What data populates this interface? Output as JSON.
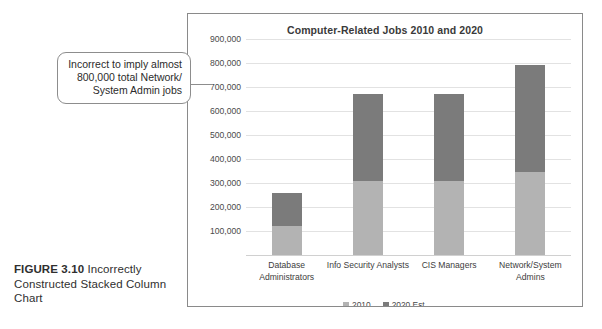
{
  "figure": {
    "label": "FIGURE 3.10",
    "caption": "Incorrectly Constructed Stacked Column Chart"
  },
  "callout": {
    "line1": "Incorrect to imply almost",
    "line2": "800,000 total Network/",
    "line3": "System Admin jobs"
  },
  "legend": {
    "items": [
      {
        "label": "2010",
        "color": "#b3b3b3"
      },
      {
        "label": "2020 Est.",
        "color": "#7b7b7b"
      }
    ]
  },
  "colors": {
    "series_2010": "#b3b3b3",
    "series_2020": "#7b7b7b",
    "gridline": "#e2e2e2",
    "frame_border": "#8a8a8a",
    "callout_border": "#8d8d8d"
  },
  "chart_data": {
    "type": "bar",
    "stacked": true,
    "title": "Computer-Related Jobs 2010 and 2020",
    "xlabel": "",
    "ylabel": "",
    "ylim": [
      0,
      900000
    ],
    "ytick_values": [
      900000,
      800000,
      700000,
      600000,
      500000,
      400000,
      300000,
      200000,
      100000
    ],
    "ytick_labels": [
      "900,000",
      "800,000",
      "700,000",
      "600,000",
      "500,000",
      "400,000",
      "300,000",
      "200,000",
      "100,000"
    ],
    "grid": true,
    "legend_position": "bottom",
    "categories": [
      "Database Administrators",
      "Info Security Analysts",
      "CIS Managers",
      "Network/System Admins"
    ],
    "series": [
      {
        "name": "2010",
        "values": [
          120000,
          310000,
          310000,
          345000
        ]
      },
      {
        "name": "2020 Est.",
        "values": [
          140000,
          360000,
          360000,
          445000
        ]
      }
    ],
    "stack_totals": [
      260000,
      670000,
      670000,
      790000
    ]
  }
}
